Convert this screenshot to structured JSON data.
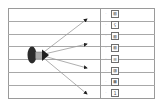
{
  "figure": {
    "kind": "diagram",
    "title": "",
    "background_color": "#ffffff",
    "border_color": "#9a9a9a",
    "rule_color": "#a8a8a8"
  },
  "grid": {
    "row_count": 8,
    "rule_positions_y": [
      8,
      21,
      34,
      46,
      59,
      72,
      85,
      98
    ],
    "column_divider_x": 100
  },
  "source": {
    "name": "source-marker",
    "shape": "filled-ellipse",
    "color": "#2b2b2b",
    "center_x": 34,
    "center_y": 55,
    "connector_color": "#9b9b9b",
    "arrow_color": "#1f1f1f"
  },
  "arrows": [
    {
      "id": "arrow-1",
      "from_x": 40,
      "from_y": 55,
      "to_x": 87,
      "to_y": 19
    },
    {
      "id": "arrow-2",
      "from_x": 40,
      "from_y": 55,
      "to_x": 87,
      "to_y": 44
    },
    {
      "id": "arrow-3",
      "from_x": 40,
      "from_y": 55,
      "to_x": 87,
      "to_y": 68
    },
    {
      "id": "arrow-4",
      "from_x": 40,
      "from_y": 55,
      "to_x": 87,
      "to_y": 94
    }
  ],
  "labels": {
    "bullet": "·",
    "rows": [
      {
        "glyph": "▨"
      },
      {
        "glyph": "ʕ"
      },
      {
        "glyph": "▨"
      },
      {
        "glyph": "▨"
      },
      {
        "glyph": "⊞"
      },
      {
        "glyph": "▧"
      },
      {
        "glyph": "▦"
      },
      {
        "glyph": "1"
      }
    ]
  }
}
